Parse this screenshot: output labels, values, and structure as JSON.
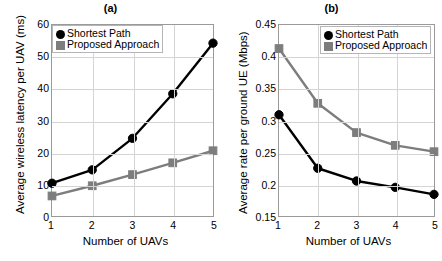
{
  "figure": {
    "width": 442,
    "height": 261,
    "background": "#ffffff"
  },
  "colors": {
    "shortest_path": "#000000",
    "proposed_approach": "#7d7d7d",
    "grid": "#d4d4d4",
    "axis": "#9a9a9a",
    "text": "#000000"
  },
  "panels": [
    {
      "id": "a",
      "title": "(a)",
      "xlabel": "Number of UAVs",
      "ylabel": "Average wireless latency per UAV (ms)",
      "xticks": [
        "1",
        "2",
        "3",
        "4",
        "5"
      ],
      "yticks": [
        "0",
        "10",
        "20",
        "30",
        "40",
        "50",
        "60"
      ],
      "legend": [
        {
          "label": "Shortest Path",
          "marker": "circle-marker",
          "color": "#000000"
        },
        {
          "label": "Proposed Approach",
          "marker": "square-marker",
          "color": "#7d7d7d"
        }
      ]
    },
    {
      "id": "b",
      "title": "(b)",
      "xlabel": "Number of UAVs",
      "ylabel": "Average rate per ground UE (Mbps)",
      "xticks": [
        "1",
        "2",
        "3",
        "4",
        "5"
      ],
      "yticks": [
        "0.15",
        "0.2",
        "0.25",
        "0.3",
        "0.35",
        "0.4",
        "0.45"
      ],
      "legend": [
        {
          "label": "Shortest Path",
          "marker": "circle-marker",
          "color": "#000000"
        },
        {
          "label": "Proposed Approach",
          "marker": "square-marker",
          "color": "#7d7d7d"
        }
      ]
    }
  ],
  "chart_data": [
    {
      "type": "line",
      "title": "(a)",
      "xlabel": "Number of UAVs",
      "ylabel": "Average wireless latency per UAV (ms)",
      "categories": [
        1,
        2,
        3,
        4,
        5
      ],
      "x": [
        1,
        2,
        3,
        4,
        5
      ],
      "xlim": [
        1,
        5
      ],
      "ylim": [
        0,
        60
      ],
      "yticks": [
        0,
        10,
        20,
        30,
        40,
        50,
        60
      ],
      "xticks": [
        1,
        2,
        3,
        4,
        5
      ],
      "grid": true,
      "legend_position": "upper-left",
      "series": [
        {
          "name": "Shortest Path",
          "color": "#000000",
          "marker": "circle",
          "values": [
            10.3,
            14.5,
            24.4,
            38.4,
            54.3
          ]
        },
        {
          "name": "Proposed Approach",
          "color": "#7d7d7d",
          "marker": "square",
          "values": [
            6.3,
            9.5,
            13.0,
            16.7,
            20.5
          ]
        }
      ]
    },
    {
      "type": "line",
      "title": "(b)",
      "xlabel": "Number of UAVs",
      "ylabel": "Average rate per ground UE (Mbps)",
      "categories": [
        1,
        2,
        3,
        4,
        5
      ],
      "x": [
        1,
        2,
        3,
        4,
        5
      ],
      "xlim": [
        1,
        5
      ],
      "ylim": [
        0.15,
        0.45
      ],
      "yticks": [
        0.15,
        0.2,
        0.25,
        0.3,
        0.35,
        0.4,
        0.45
      ],
      "xticks": [
        1,
        2,
        3,
        4,
        5
      ],
      "grid": true,
      "legend_position": "upper-right",
      "series": [
        {
          "name": "Shortest Path",
          "color": "#000000",
          "marker": "circle",
          "values": [
            0.309,
            0.225,
            0.205,
            0.195,
            0.184
          ]
        },
        {
          "name": "Proposed Approach",
          "color": "#7d7d7d",
          "marker": "square",
          "values": [
            0.413,
            0.327,
            0.281,
            0.261,
            0.251
          ]
        }
      ]
    }
  ]
}
